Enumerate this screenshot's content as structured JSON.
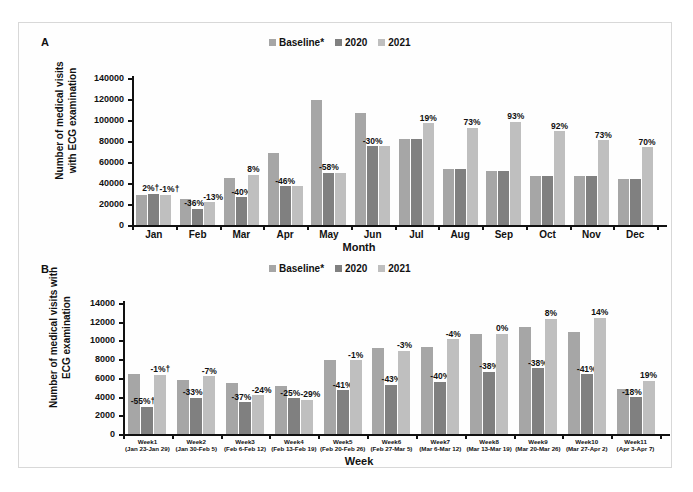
{
  "figure": {
    "panels": [
      {
        "letter": "A"
      },
      {
        "letter": "B"
      }
    ]
  },
  "legend": {
    "items": [
      {
        "label": "Baseline*",
        "color": "#a6a6a6"
      },
      {
        "label": "2020",
        "color": "#808080"
      },
      {
        "label": "2021",
        "color": "#bfbfbf"
      }
    ]
  },
  "chart_data": [
    {
      "type": "bar",
      "panel": "A",
      "title": "",
      "xlabel": "Month",
      "ylabel": "Number of medical visits\nwith ECG examination",
      "ylim": [
        0,
        140000
      ],
      "yticks": [
        0,
        20000,
        40000,
        60000,
        80000,
        100000,
        120000,
        140000
      ],
      "grid": false,
      "legend_position": "top-center",
      "categories": [
        "Jan",
        "Feb",
        "Mar",
        "Apr",
        "May",
        "Jun",
        "Jul",
        "Aug",
        "Sep",
        "Oct",
        "Nov",
        "Dec"
      ],
      "series": [
        {
          "name": "Baseline*",
          "color": "#a6a6a6",
          "values": [
            29000,
            24500,
            44500,
            68500,
            119500,
            106500,
            81500,
            53500,
            51000,
            46500,
            46500,
            43500
          ]
        },
        {
          "name": "2020",
          "color": "#808080",
          "values": [
            30000,
            15500,
            26500,
            37000,
            50000,
            75000,
            82000,
            53500,
            51000,
            46500,
            46500,
            43500
          ]
        },
        {
          "name": "2021",
          "color": "#bfbfbf",
          "values": [
            29000,
            21500,
            48000,
            37000,
            50000,
            75000,
            97000,
            92500,
            98500,
            89500,
            80500,
            74000
          ]
        }
      ],
      "annotations": [
        {
          "category": "Jan",
          "series": "2020",
          "text": "2%†"
        },
        {
          "category": "Jan",
          "series": "2021",
          "text": "-1%†"
        },
        {
          "category": "Feb",
          "series": "2020",
          "text": "-36%"
        },
        {
          "category": "Feb",
          "series": "2021",
          "text": "-13%"
        },
        {
          "category": "Mar",
          "series": "2020",
          "text": "-40%"
        },
        {
          "category": "Mar",
          "series": "2021",
          "text": "8%"
        },
        {
          "category": "Apr",
          "series": "2021",
          "text": "-46%"
        },
        {
          "category": "May",
          "series": "2021",
          "text": "-58%"
        },
        {
          "category": "Jun",
          "series": "2021",
          "text": "-30%"
        },
        {
          "category": "Jul",
          "series": "2021",
          "text": "19%"
        },
        {
          "category": "Aug",
          "series": "2021",
          "text": "73%"
        },
        {
          "category": "Sep",
          "series": "2021",
          "text": "93%"
        },
        {
          "category": "Oct",
          "series": "2021",
          "text": "92%"
        },
        {
          "category": "Nov",
          "series": "2021",
          "text": "73%"
        },
        {
          "category": "Dec",
          "series": "2021",
          "text": "70%"
        }
      ],
      "bars": [
        {
          "cat": "Jan",
          "items": [
            {
              "series": "Baseline*",
              "value": 29000,
              "label": ""
            },
            {
              "series": "2020",
              "value": 30000,
              "label": "2%†",
              "nudge": "left"
            },
            {
              "series": "2021",
              "value": 29000,
              "label": "-1%†",
              "nudge": "right"
            }
          ]
        },
        {
          "cat": "Feb",
          "items": [
            {
              "series": "Baseline*",
              "value": 24500,
              "label": ""
            },
            {
              "series": "2020",
              "value": 15500,
              "label": "-36%",
              "nudge": "left"
            },
            {
              "series": "2021",
              "value": 21500,
              "label": "-13%",
              "nudge": "right"
            }
          ]
        },
        {
          "cat": "Mar",
          "items": [
            {
              "series": "Baseline*",
              "value": 44500,
              "label": ""
            },
            {
              "series": "2020",
              "value": 26500,
              "label": "-40%",
              "nudge": ""
            },
            {
              "series": "2021",
              "value": 48000,
              "label": "8%",
              "nudge": ""
            }
          ]
        },
        {
          "cat": "Apr",
          "items": [
            {
              "series": "Baseline*",
              "value": 68500,
              "label": ""
            },
            {
              "series": "2020",
              "value": 37000,
              "label": "-46%",
              "nudge": ""
            },
            {
              "series": "2021",
              "value": 37000,
              "label": "",
              "nudge": ""
            }
          ]
        },
        {
          "cat": "May",
          "items": [
            {
              "series": "Baseline*",
              "value": 119500,
              "label": ""
            },
            {
              "series": "2020",
              "value": 50000,
              "label": "-58%",
              "nudge": ""
            },
            {
              "series": "2021",
              "value": 50000,
              "label": "",
              "nudge": ""
            }
          ]
        },
        {
          "cat": "Jun",
          "items": [
            {
              "series": "Baseline*",
              "value": 106500,
              "label": ""
            },
            {
              "series": "2020",
              "value": 75000,
              "label": "-30%",
              "nudge": ""
            },
            {
              "series": "2021",
              "value": 75000,
              "label": "",
              "nudge": ""
            }
          ]
        },
        {
          "cat": "Jul",
          "items": [
            {
              "series": "Baseline*",
              "value": 81500,
              "label": ""
            },
            {
              "series": "2020",
              "value": 82000,
              "label": "",
              "nudge": ""
            },
            {
              "series": "2021",
              "value": 97000,
              "label": "19%",
              "nudge": ""
            }
          ]
        },
        {
          "cat": "Aug",
          "items": [
            {
              "series": "Baseline*",
              "value": 53500,
              "label": ""
            },
            {
              "series": "2020",
              "value": 53500,
              "label": "",
              "nudge": ""
            },
            {
              "series": "2021",
              "value": 92500,
              "label": "73%",
              "nudge": ""
            }
          ]
        },
        {
          "cat": "Sep",
          "items": [
            {
              "series": "Baseline*",
              "value": 51000,
              "label": ""
            },
            {
              "series": "2020",
              "value": 51000,
              "label": "",
              "nudge": ""
            },
            {
              "series": "2021",
              "value": 98500,
              "label": "93%",
              "nudge": ""
            }
          ]
        },
        {
          "cat": "Oct",
          "items": [
            {
              "series": "Baseline*",
              "value": 46500,
              "label": ""
            },
            {
              "series": "2020",
              "value": 46500,
              "label": "",
              "nudge": ""
            },
            {
              "series": "2021",
              "value": 89500,
              "label": "92%",
              "nudge": ""
            }
          ]
        },
        {
          "cat": "Nov",
          "items": [
            {
              "series": "Baseline*",
              "value": 46500,
              "label": ""
            },
            {
              "series": "2020",
              "value": 46500,
              "label": "",
              "nudge": ""
            },
            {
              "series": "2021",
              "value": 80500,
              "label": "73%",
              "nudge": ""
            }
          ]
        },
        {
          "cat": "Dec",
          "items": [
            {
              "series": "Baseline*",
              "value": 43500,
              "label": ""
            },
            {
              "series": "2020",
              "value": 43500,
              "label": "",
              "nudge": ""
            },
            {
              "series": "2021",
              "value": 74000,
              "label": "70%",
              "nudge": ""
            }
          ]
        }
      ]
    },
    {
      "type": "bar",
      "panel": "B",
      "title": "",
      "xlabel": "Week",
      "ylabel": "Number of medical visits with\nECG examination",
      "ylim": [
        0,
        14000
      ],
      "yticks": [
        0,
        2000,
        4000,
        6000,
        8000,
        10000,
        12000,
        14000
      ],
      "grid": false,
      "legend_position": "top-center",
      "categories": [
        {
          "week": "Week1",
          "range": "(Jan 23-Jan 29)"
        },
        {
          "week": "Week2",
          "range": "(Jan 30-Feb 5)"
        },
        {
          "week": "Week3",
          "range": "(Feb 6-Feb 12)"
        },
        {
          "week": "Week4",
          "range": "(Feb 13-Feb 19)"
        },
        {
          "week": "Week5",
          "range": "(Feb 20-Feb 26)"
        },
        {
          "week": "Week6",
          "range": "(Feb 27-Mar 5)"
        },
        {
          "week": "Week7",
          "range": "(Mar 6-Mar 12)"
        },
        {
          "week": "Week8",
          "range": "(Mar 13-Mar 19)"
        },
        {
          "week": "Week9",
          "range": "(Mar 20-Mar 26)"
        },
        {
          "week": "Week10",
          "range": "(Mar 27-Apr 2)"
        },
        {
          "week": "Week11",
          "range": "(Apr 3-Apr 7)"
        }
      ],
      "series": [
        {
          "name": "Baseline*",
          "color": "#a6a6a6",
          "values": [
            6400,
            5750,
            5400,
            5100,
            7950,
            9150,
            9350,
            10700,
            11400,
            10850,
            4800
          ]
        },
        {
          "name": "2020",
          "color": "#808080",
          "values": [
            2900,
            3850,
            3400,
            3800,
            4700,
            5250,
            5600,
            6650,
            7050,
            6400,
            3950
          ]
        },
        {
          "name": "2021",
          "color": "#bfbfbf",
          "values": [
            6350,
            6150,
            4150,
            3650,
            7900,
            8900,
            10150,
            10700,
            12300,
            12400,
            5700
          ]
        }
      ],
      "bars": [
        {
          "cat": "Week1",
          "items": [
            {
              "series": "Baseline*",
              "value": 6400,
              "label": ""
            },
            {
              "series": "2020",
              "value": 2900,
              "label": "-55%†",
              "nudge": "left"
            },
            {
              "series": "2021",
              "value": 6350,
              "label": "-1%†",
              "nudge": ""
            }
          ]
        },
        {
          "cat": "Week2",
          "items": [
            {
              "series": "Baseline*",
              "value": 5750,
              "label": ""
            },
            {
              "series": "2020",
              "value": 3850,
              "label": "-33%",
              "nudge": "left"
            },
            {
              "series": "2021",
              "value": 6150,
              "label": "-7%",
              "nudge": ""
            }
          ]
        },
        {
          "cat": "Week3",
          "items": [
            {
              "series": "Baseline*",
              "value": 5400,
              "label": ""
            },
            {
              "series": "2020",
              "value": 3400,
              "label": "-37%",
              "nudge": "left"
            },
            {
              "series": "2021",
              "value": 4150,
              "label": "-24%",
              "nudge": "right"
            }
          ]
        },
        {
          "cat": "Week4",
          "items": [
            {
              "series": "Baseline*",
              "value": 5100,
              "label": ""
            },
            {
              "series": "2020",
              "value": 3800,
              "label": "-25%",
              "nudge": "left"
            },
            {
              "series": "2021",
              "value": 3650,
              "label": "-29%",
              "nudge": "right"
            }
          ]
        },
        {
          "cat": "Week5",
          "items": [
            {
              "series": "Baseline*",
              "value": 7950,
              "label": ""
            },
            {
              "series": "2020",
              "value": 4700,
              "label": "-41%",
              "nudge": ""
            },
            {
              "series": "2021",
              "value": 7900,
              "label": "-1%",
              "nudge": ""
            }
          ]
        },
        {
          "cat": "Week6",
          "items": [
            {
              "series": "Baseline*",
              "value": 9150,
              "label": ""
            },
            {
              "series": "2020",
              "value": 5250,
              "label": "-43%",
              "nudge": ""
            },
            {
              "series": "2021",
              "value": 8900,
              "label": "-3%",
              "nudge": ""
            }
          ]
        },
        {
          "cat": "Week7",
          "items": [
            {
              "series": "Baseline*",
              "value": 9350,
              "label": ""
            },
            {
              "series": "2020",
              "value": 5600,
              "label": "-40%",
              "nudge": ""
            },
            {
              "series": "2021",
              "value": 10150,
              "label": "-4%",
              "nudge": ""
            }
          ]
        },
        {
          "cat": "Week8",
          "items": [
            {
              "series": "Baseline*",
              "value": 10700,
              "label": ""
            },
            {
              "series": "2020",
              "value": 6650,
              "label": "-38%",
              "nudge": ""
            },
            {
              "series": "2021",
              "value": 10700,
              "label": "0%",
              "nudge": ""
            }
          ]
        },
        {
          "cat": "Week9",
          "items": [
            {
              "series": "Baseline*",
              "value": 11400,
              "label": ""
            },
            {
              "series": "2020",
              "value": 7050,
              "label": "-38%",
              "nudge": ""
            },
            {
              "series": "2021",
              "value": 12300,
              "label": "8%",
              "nudge": ""
            }
          ]
        },
        {
          "cat": "Week10",
          "items": [
            {
              "series": "Baseline*",
              "value": 10850,
              "label": ""
            },
            {
              "series": "2020",
              "value": 6400,
              "label": "-41%",
              "nudge": ""
            },
            {
              "series": "2021",
              "value": 12400,
              "label": "14%",
              "nudge": ""
            }
          ]
        },
        {
          "cat": "Week11",
          "items": [
            {
              "series": "Baseline*",
              "value": 4800,
              "label": ""
            },
            {
              "series": "2020",
              "value": 3950,
              "label": "-18%",
              "nudge": "left"
            },
            {
              "series": "2021",
              "value": 5700,
              "label": "19%",
              "nudge": ""
            }
          ]
        }
      ]
    }
  ]
}
